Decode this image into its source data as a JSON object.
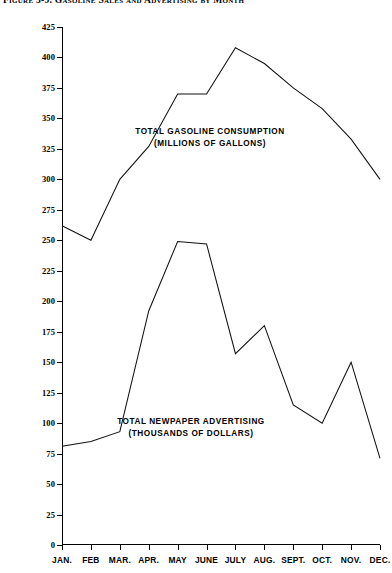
{
  "figure": {
    "title": "Figure 3-9. Gasoline Sales and Advertising by Month"
  },
  "chart_data": {
    "type": "line",
    "title": "Figure 3-9. Gasoline Sales and Advertising by Month",
    "xlabel": "",
    "ylabel": "",
    "ylim": [
      0,
      425
    ],
    "grid": false,
    "legend_position": "inline-annotations",
    "categories": [
      "JAN.",
      "FEB",
      "MAR.",
      "APR.",
      "MAY",
      "JUNE",
      "JULY",
      "AUG.",
      "SEPT.",
      "OCT.",
      "NOV.",
      "DEC."
    ],
    "y_ticks": [
      0,
      25,
      50,
      75,
      100,
      125,
      150,
      175,
      200,
      225,
      250,
      275,
      300,
      325,
      350,
      375,
      400,
      425
    ],
    "series": [
      {
        "name": "TOTAL GASOLINE CONSUMPTION",
        "units": "(MILLIONS OF GALLONS)",
        "values": [
          262,
          250,
          300,
          327,
          370,
          370,
          408,
          395,
          375,
          358,
          333,
          300
        ]
      },
      {
        "name": "TOTAL NEWPAPER ADVERTISING",
        "units": "(THOUSANDS OF DOLLARS)",
        "values": [
          81,
          85,
          93,
          192,
          249,
          247,
          157,
          180,
          115,
          100,
          150,
          71
        ]
      }
    ],
    "annotations": [
      {
        "line1": "TOTAL GASOLINE CONSUMPTION",
        "line2": "(MILLIONS OF GALLONS)"
      },
      {
        "line1": "TOTAL NEWPAPER ADVERTISING",
        "line2": "(THOUSANDS OF DOLLARS)"
      }
    ],
    "colors": {
      "line": "#111111",
      "background": "#ffffff",
      "axis": "#000000"
    }
  }
}
